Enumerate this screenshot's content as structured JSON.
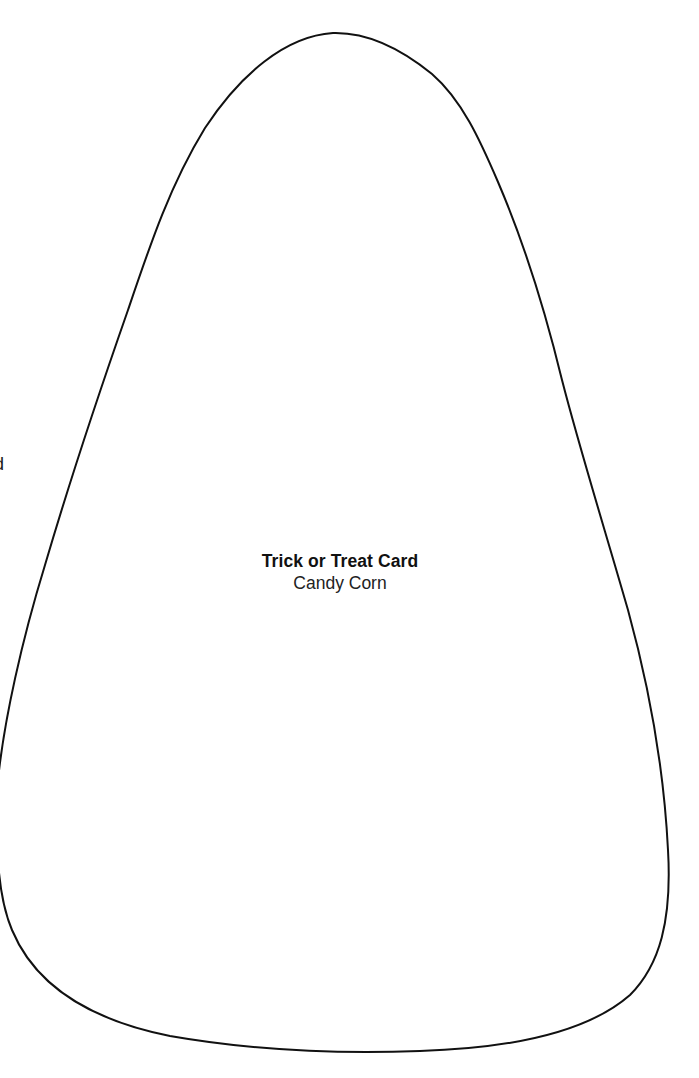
{
  "document": {
    "background_color": "#ffffff",
    "outline_color": "#111111",
    "shape": "candy-corn-outline",
    "edge_fragment_text": "d"
  },
  "card": {
    "title": "Trick or Treat Card",
    "subtitle": "Candy Corn"
  }
}
